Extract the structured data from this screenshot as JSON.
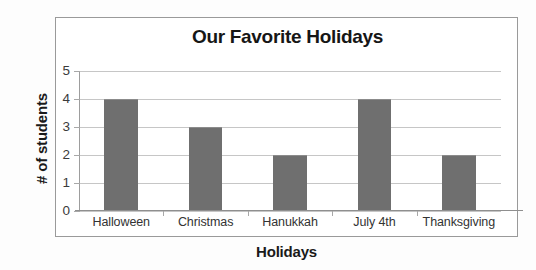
{
  "chart_data": {
    "type": "bar",
    "title": "Our Favorite Holidays",
    "xlabel": "Holidays",
    "ylabel": "# of students",
    "categories": [
      "Halloween",
      "Christmas",
      "Hanukkah",
      "July 4th",
      "Thanksgiving"
    ],
    "values": [
      4,
      3,
      2,
      4,
      2
    ],
    "ylim": [
      0,
      5
    ],
    "ytick_labels": [
      "5",
      "4",
      "3",
      "2",
      "1",
      "0"
    ],
    "ytick_values": [
      5,
      4,
      3,
      2,
      1,
      0
    ],
    "grid": true,
    "legend": false,
    "bar_color": "#6f6f6f",
    "gridline_color": "#c6c6c6",
    "axis_color": "#9a9a9a",
    "background_color": "#ffffff"
  },
  "chart": {
    "title": "Our Favorite Holidays",
    "x_axis_title": "Holidays",
    "y_axis_title": "# of students"
  }
}
